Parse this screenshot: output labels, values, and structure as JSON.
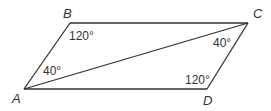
{
  "diagram": {
    "type": "parallelogram",
    "stroke_color": "#333333",
    "vertices": [
      {
        "id": "A",
        "label": "A",
        "x": 24,
        "y": 89,
        "label_x": 12,
        "label_y": 103
      },
      {
        "id": "B",
        "label": "B",
        "x": 70,
        "y": 23,
        "label_x": 63,
        "label_y": 18
      },
      {
        "id": "C",
        "label": "C",
        "x": 248,
        "y": 23,
        "label_x": 253,
        "label_y": 18
      },
      {
        "id": "D",
        "label": "D",
        "x": 207,
        "y": 89,
        "label_x": 203,
        "label_y": 105
      }
    ],
    "edges": [
      {
        "from": "A",
        "to": "B"
      },
      {
        "from": "B",
        "to": "C"
      },
      {
        "from": "C",
        "to": "D"
      },
      {
        "from": "D",
        "to": "A"
      },
      {
        "from": "A",
        "to": "C",
        "kind": "diagonal"
      }
    ],
    "angles": [
      {
        "at": "B",
        "label": "120°",
        "x": 69,
        "y": 40
      },
      {
        "at": "A",
        "label": "40°",
        "x": 43,
        "y": 75
      },
      {
        "at": "C",
        "label": "40°",
        "x": 213,
        "y": 47
      },
      {
        "at": "D",
        "label": "120°",
        "x": 185,
        "y": 84
      }
    ]
  }
}
